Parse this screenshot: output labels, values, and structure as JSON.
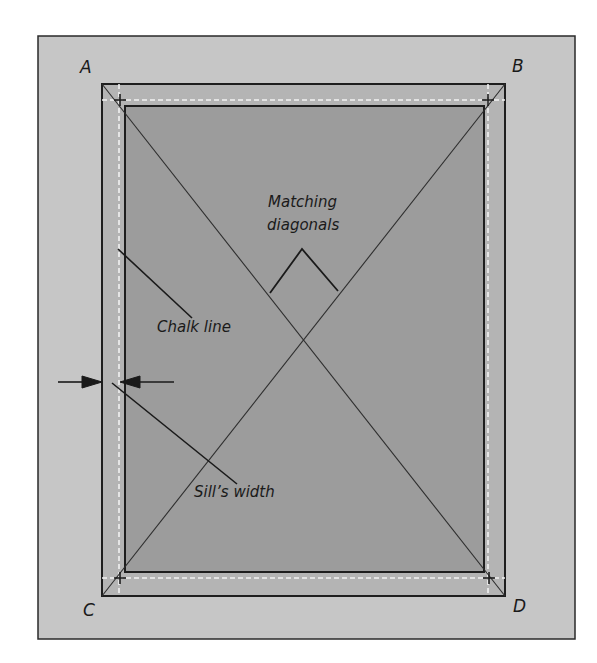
{
  "diagram": {
    "type": "layout-diagram",
    "corners": {
      "top_left": "A",
      "top_right": "B",
      "bottom_left": "C",
      "bottom_right": "D"
    },
    "annotations": {
      "matching_diagonals_line1": "Matching",
      "matching_diagonals_line2": "diagonals",
      "chalk_line": "Chalk line",
      "sills_width": "Sill’s width"
    },
    "colors": {
      "page_background": "#ffffff",
      "outer_panel": "#c6c6c6",
      "frame_band": "#b4b4b4",
      "inner_panel": "#9c9c9c",
      "lines": "#1e1e1e",
      "chalk_line": "#f2f2f2"
    }
  }
}
